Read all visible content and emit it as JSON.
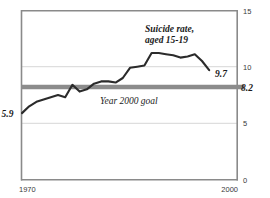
{
  "chart_data": {
    "type": "line",
    "title": "",
    "xlabel": "",
    "ylabel": "",
    "xlim": [
      1970,
      2000
    ],
    "ylim": [
      0,
      15
    ],
    "grid": true,
    "gridlines_y": [
      5,
      10
    ],
    "y_ticks": [
      "15",
      "10",
      "5",
      "0"
    ],
    "y_tick_values": [
      15,
      10,
      5,
      0
    ],
    "x_ticks": [
      "1970",
      "2000"
    ],
    "x_tick_values": [
      1970,
      2000
    ],
    "legend_position": "inline-annotation",
    "series": [
      {
        "name": "Suicide rate, aged 15-19",
        "color": "#2b2b2b",
        "x": [
          1970,
          1971,
          1972,
          1973,
          1974,
          1975,
          1976,
          1977,
          1978,
          1979,
          1980,
          1981,
          1982,
          1983,
          1984,
          1985,
          1986,
          1987,
          1988,
          1989,
          1990,
          1991,
          1992,
          1993,
          1994,
          1995,
          1996
        ],
        "values": [
          5.9,
          6.5,
          6.9,
          7.1,
          7.3,
          7.5,
          7.3,
          8.4,
          7.8,
          8.0,
          8.5,
          8.7,
          8.7,
          8.6,
          9.0,
          9.9,
          10.0,
          10.1,
          11.2,
          11.2,
          11.1,
          11.0,
          10.8,
          10.9,
          11.1,
          10.5,
          9.7
        ]
      }
    ],
    "reference_line": {
      "label": "Year 2000 goal",
      "value": 8.2,
      "value_label": "8.2",
      "color": "#8c8c8c"
    },
    "annotations": [
      {
        "id": "series-annot",
        "text_line1": "Suicide rate,",
        "text_line2": "aged 15-19"
      },
      {
        "id": "goal-annot",
        "text": "Year 2000 goal"
      },
      {
        "id": "start-value",
        "text": "5.9"
      },
      {
        "id": "end-value",
        "text": "9.7"
      }
    ],
    "colors": {
      "series_line": "#2b2b2b",
      "goal_line": "#8c8c8c",
      "frame": "#8a8a8a",
      "gridline": "#dcdcdc",
      "background": "#ffffff"
    }
  },
  "axis": {
    "y_right": {
      "t15": "15",
      "t10": "10",
      "t82": "8.2",
      "t5": "5",
      "t0": "0"
    },
    "x_bottom": {
      "start": "1970",
      "end": "2000"
    }
  },
  "labels": {
    "series_line1": "Suicide rate,",
    "series_line2": "aged 15-19",
    "goal": "Year 2000 goal",
    "start_value": "5.9",
    "end_value": "9.7"
  }
}
